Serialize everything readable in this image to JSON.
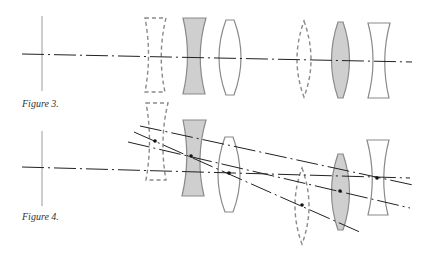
{
  "figures": [
    {
      "caption": "Figure 3.",
      "description": "Optical system with all lens elements aligned on a common axis"
    },
    {
      "caption": "Figure 4.",
      "description": "Optical system with lens elements decentered and tilted, showing displaced axes"
    }
  ],
  "colors": {
    "axis_line": "#222222",
    "lens_outline": "#8a8a8a",
    "lens_fill_shaded": "#cfcfcf",
    "object_line": "#9a9a9a",
    "center_dot": "#111111"
  },
  "legend": {
    "dashed_lens": "element in reference (removed) position",
    "shaded_lens": "shaded element",
    "plain_lens": "plain element"
  }
}
